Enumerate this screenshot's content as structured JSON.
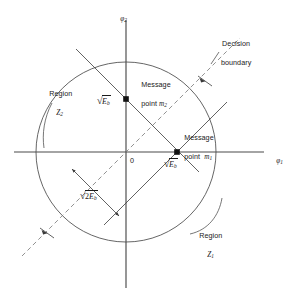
{
  "figure": {
    "kind": "signal-space-diagram",
    "axes": {
      "x_label": "φ",
      "x_label_sub": "1",
      "y_label": "φ",
      "y_label_sub": "2",
      "origin_label": "0"
    },
    "geometry": {
      "origin_x": 126,
      "origin_y": 152,
      "circle_radius": 90,
      "message_point_radius_px": 51,
      "stroke_color": "#3a3a3a",
      "axis_color": "#4a4a4a",
      "dash_color": "#6b6b6b",
      "dot_color": "#111111",
      "text_color": "#1a1a1a"
    },
    "message_points": [
      {
        "id": "m1",
        "name_line1": "Message",
        "name_line2": "point",
        "symbol": "m",
        "symbol_sub": "1",
        "x": 177,
        "y": 152,
        "distance_label_prefix": "",
        "distance_label_base": "E",
        "distance_label_sub": "b"
      },
      {
        "id": "m2",
        "name_line1": "Message",
        "name_line2": "point",
        "symbol": "m",
        "symbol_sub": "2",
        "x": 126,
        "y": 99,
        "distance_label_prefix": "",
        "distance_label_base": "E",
        "distance_label_sub": "b"
      }
    ],
    "regions": [
      {
        "id": "Z1",
        "line1": "Region",
        "symbol": "Z",
        "symbol_sub": "1"
      },
      {
        "id": "Z2",
        "line1": "Region",
        "symbol": "Z",
        "symbol_sub": "2"
      }
    ],
    "decision_boundary": {
      "line1": "Decision",
      "line2": "boundary",
      "style": "dashed",
      "angle_deg": 45
    },
    "separation_measure": {
      "prefix": "2",
      "base": "E",
      "sub": "b",
      "arrow": "double-headed"
    }
  }
}
